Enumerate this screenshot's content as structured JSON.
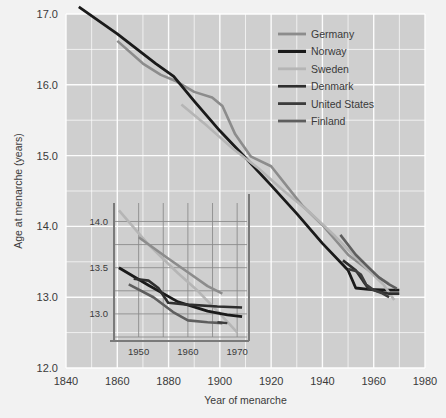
{
  "figure": {
    "background": "#f2f2f2",
    "plot_background": "#cfcfcf",
    "gridline_color": "#ffffff",
    "text_color": "#3a3a3a"
  },
  "chart_data": {
    "type": "line",
    "title": "",
    "xlabel": "Year of menarche",
    "ylabel": "Age at menarche (years)",
    "xlim": [
      1840,
      1980
    ],
    "ylim": [
      12.0,
      17.0
    ],
    "x_ticks": [
      1840,
      1860,
      1880,
      1900,
      1920,
      1940,
      1960,
      1980
    ],
    "x_tick_labels": [
      "1840",
      "1860",
      "1880",
      "1900",
      "1920",
      "1940",
      "1960",
      "1980"
    ],
    "x_minor_step": 10,
    "y_ticks": [
      12.0,
      13.0,
      14.0,
      15.0,
      16.0,
      17.0
    ],
    "y_tick_labels": [
      "12.0",
      "13.0",
      "14.0",
      "15.0",
      "16.0",
      "17.0"
    ],
    "y_minor_step": 0.5,
    "grid": true,
    "legend_position": "top-right",
    "series": [
      {
        "name": "Germany",
        "color": "#8c8c8c",
        "width": 2.6,
        "points": [
          [
            1860,
            16.62
          ],
          [
            1870,
            16.3
          ],
          [
            1877,
            16.14
          ],
          [
            1883,
            16.05
          ],
          [
            1890,
            15.9
          ],
          [
            1897,
            15.82
          ],
          [
            1901,
            15.7
          ],
          [
            1906,
            15.3
          ],
          [
            1912,
            14.99
          ],
          [
            1920,
            14.85
          ],
          [
            1932,
            14.3
          ],
          [
            1940,
            14.02
          ],
          [
            1950,
            13.6
          ],
          [
            1958,
            13.38
          ],
          [
            1962,
            13.28
          ],
          [
            1966,
            13.19
          ]
        ]
      },
      {
        "name": "Norway",
        "color": "#1a1a1a",
        "width": 2.8,
        "points": [
          [
            1845,
            17.1
          ],
          [
            1860,
            16.72
          ],
          [
            1875,
            16.3
          ],
          [
            1882,
            16.12
          ],
          [
            1890,
            15.77
          ],
          [
            1900,
            15.35
          ],
          [
            1910,
            14.97
          ],
          [
            1920,
            14.58
          ],
          [
            1930,
            14.18
          ],
          [
            1940,
            13.76
          ],
          [
            1950,
            13.38
          ],
          [
            1953,
            13.13
          ],
          [
            1958,
            13.11
          ],
          [
            1966,
            13.1
          ],
          [
            1970,
            13.1
          ]
        ]
      },
      {
        "name": "Sweden",
        "color": "#b5b5b5",
        "width": 2.6,
        "points": [
          [
            1885,
            15.72
          ],
          [
            1895,
            15.42
          ],
          [
            1905,
            15.1
          ],
          [
            1915,
            14.82
          ],
          [
            1925,
            14.5
          ],
          [
            1935,
            14.2
          ],
          [
            1945,
            13.86
          ],
          [
            1952,
            13.6
          ],
          [
            1958,
            13.38
          ],
          [
            1964,
            13.17
          ],
          [
            1968,
            12.96
          ]
        ]
      },
      {
        "name": "Denmark",
        "color": "#2e2e2e",
        "width": 2.6,
        "points": [
          [
            1948,
            13.52
          ],
          [
            1953,
            13.38
          ],
          [
            1956,
            13.22
          ],
          [
            1958,
            13.12
          ],
          [
            1962,
            13.08
          ],
          [
            1966,
            13.05
          ],
          [
            1970,
            13.05
          ]
        ]
      },
      {
        "name": "United States",
        "color": "#3c3c3c",
        "width": 2.6,
        "points": [
          [
            1950,
            13.4
          ],
          [
            1953,
            13.37
          ],
          [
            1955,
            13.32
          ],
          [
            1957,
            13.18
          ],
          [
            1960,
            13.1
          ],
          [
            1963,
            13.06
          ],
          [
            1966,
            13.0
          ]
        ]
      },
      {
        "name": "Finland",
        "color": "#5e5e5e",
        "width": 2.6,
        "points": [
          [
            1947,
            13.88
          ],
          [
            1953,
            13.6
          ],
          [
            1958,
            13.42
          ],
          [
            1962,
            13.28
          ],
          [
            1966,
            13.18
          ],
          [
            1969,
            13.12
          ]
        ]
      }
    ]
  },
  "inset": {
    "type": "line",
    "xlim": [
      1945,
      1972
    ],
    "ylim": [
      12.75,
      14.2
    ],
    "x_ticks": [
      1950,
      1960,
      1970
    ],
    "x_tick_labels": [
      "1950",
      "1960",
      "1970"
    ],
    "y_ticks": [
      13.0,
      13.5,
      14.0
    ],
    "y_tick_labels": [
      "13.0",
      "13.5",
      "14.0"
    ],
    "x_minor_step": 5,
    "y_minor_step": 0.25,
    "series": [
      {
        "name": "Sweden",
        "color": "#b5b5b5",
        "width": 2.6,
        "points": [
          [
            1946,
            14.12
          ],
          [
            1952,
            13.75
          ],
          [
            1958,
            13.44
          ],
          [
            1962,
            13.25
          ],
          [
            1966,
            13.03
          ],
          [
            1970,
            12.8
          ]
        ]
      },
      {
        "name": "Germany",
        "color": "#8c8c8c",
        "width": 2.6,
        "points": [
          [
            1950,
            13.83
          ],
          [
            1956,
            13.6
          ],
          [
            1960,
            13.45
          ],
          [
            1964,
            13.3
          ],
          [
            1967,
            13.22
          ]
        ]
      },
      {
        "name": "Norway",
        "color": "#1a1a1a",
        "width": 2.8,
        "points": [
          [
            1946,
            13.5
          ],
          [
            1952,
            13.31
          ],
          [
            1958,
            13.13
          ],
          [
            1964,
            13.03
          ],
          [
            1968,
            12.99
          ],
          [
            1971,
            12.97
          ]
        ]
      },
      {
        "name": "Denmark",
        "color": "#2e2e2e",
        "width": 2.6,
        "points": [
          [
            1949,
            13.38
          ],
          [
            1952,
            13.36
          ],
          [
            1954,
            13.28
          ],
          [
            1956,
            13.12
          ],
          [
            1960,
            13.1
          ],
          [
            1966,
            13.08
          ],
          [
            1971,
            13.07
          ]
        ]
      },
      {
        "name": "Finland",
        "color": "#5e5e5e",
        "width": 2.6,
        "points": [
          [
            1948,
            13.32
          ],
          [
            1953,
            13.18
          ],
          [
            1957,
            13.02
          ],
          [
            1960,
            12.93
          ],
          [
            1964,
            12.91
          ],
          [
            1967,
            12.9
          ]
        ]
      },
      {
        "name": "United States",
        "color": "#3c3c3c",
        "width": 2.4,
        "points": [
          [
            1966,
            12.91
          ],
          [
            1968,
            12.9
          ]
        ]
      }
    ]
  },
  "legend": {
    "items": [
      {
        "label": "Germany",
        "color": "#8c8c8c"
      },
      {
        "label": "Norway",
        "color": "#1a1a1a"
      },
      {
        "label": "Sweden",
        "color": "#b5b5b5"
      },
      {
        "label": "Denmark",
        "color": "#2e2e2e"
      },
      {
        "label": "United States",
        "color": "#3c3c3c"
      },
      {
        "label": "Finland",
        "color": "#5e5e5e"
      }
    ]
  }
}
